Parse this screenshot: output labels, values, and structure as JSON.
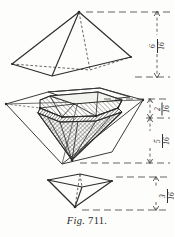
{
  "figure": {
    "caption_prefix": "Fig.",
    "caption_number": "711.",
    "ink_color": "#2b2b2b",
    "dim_color": "#3a3a3a",
    "background": "#fdfdfb"
  },
  "shapes": [
    {
      "name": "upper-square-pyramid",
      "description": "square pyramid, apex up, shown in perspective with dashed hidden edges"
    },
    {
      "name": "brilliant-cut-gem-in-octahedron",
      "description": "brilliant cut diamond with hatched crown and pavilion facets inscribed in a larger octahedron outline"
    },
    {
      "name": "lower-inverted-pyramid",
      "description": "square pyramid, apex down, shown in perspective with dashed hidden edges"
    }
  ],
  "dimensions": [
    {
      "name": "upper-pyramid-height",
      "numerator": "6",
      "denominator": "16",
      "label": "6/16"
    },
    {
      "name": "gem-crown-height",
      "numerator": "2",
      "denominator": "16",
      "label": "2/16"
    },
    {
      "name": "gem-pavilion-height",
      "numerator": "5",
      "denominator": "16",
      "label": "5/16"
    },
    {
      "name": "lower-pyramid-height",
      "numerator": "3",
      "denominator": "16",
      "label": "3/16"
    }
  ]
}
